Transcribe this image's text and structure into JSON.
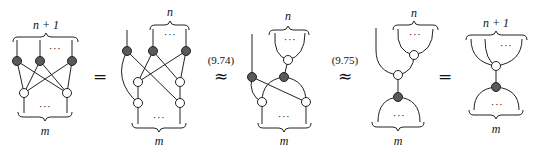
{
  "equation": {
    "diagrams": [
      {
        "id": "lhs",
        "top_label": "n + 1",
        "top_ellipsis": "···",
        "bottom_ellipsis": "···",
        "bottom_label": "m",
        "black_nodes": 3,
        "white_nodes": 2
      },
      {
        "id": "step1",
        "top_label": "n",
        "top_ellipsis": "···",
        "bottom_ellipsis": "···",
        "bottom_label": "m",
        "black_nodes": 3,
        "white_nodes": 4
      },
      {
        "id": "step2",
        "top_label": "n",
        "top_ellipsis": "···",
        "bottom_ellipsis": "···",
        "bottom_label": "m",
        "black_nodes": 2,
        "white_nodes": 3
      },
      {
        "id": "step3",
        "top_label": "n",
        "top_ellipsis": "···",
        "bottom_ellipsis": "···",
        "bottom_label": "m",
        "black_nodes": 1,
        "white_nodes": 2
      },
      {
        "id": "rhs",
        "top_label": "n + 1",
        "top_ellipsis": "···",
        "bottom_ellipsis": "···",
        "bottom_label": "m",
        "black_nodes": 1,
        "white_nodes": 1
      }
    ],
    "relations": [
      {
        "symbol": "=",
        "reference": ""
      },
      {
        "symbol": "≈",
        "reference": "(9.74)"
      },
      {
        "symbol": "≈",
        "reference": "(9.75)"
      },
      {
        "symbol": "=",
        "reference": ""
      }
    ]
  }
}
